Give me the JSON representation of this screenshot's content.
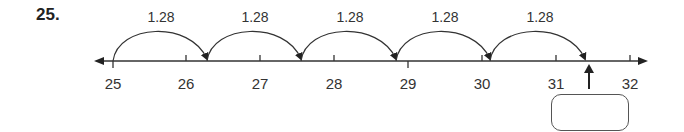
{
  "problem": {
    "number": "25.",
    "jump_value": "1.28",
    "jumps": [
      {
        "label": "1.28",
        "from": 25.0,
        "to": 26.28
      },
      {
        "label": "1.28",
        "from": 26.28,
        "to": 27.56
      },
      {
        "label": "1.28",
        "from": 27.56,
        "to": 28.84
      },
      {
        "label": "1.28",
        "from": 28.84,
        "to": 30.12
      },
      {
        "label": "1.28",
        "from": 30.12,
        "to": 31.4
      }
    ],
    "number_line": {
      "ticks": [
        "25",
        "26",
        "27",
        "28",
        "29",
        "30",
        "31",
        "32"
      ],
      "start": 25,
      "end": 32
    },
    "answer_box": {
      "value": ""
    }
  }
}
